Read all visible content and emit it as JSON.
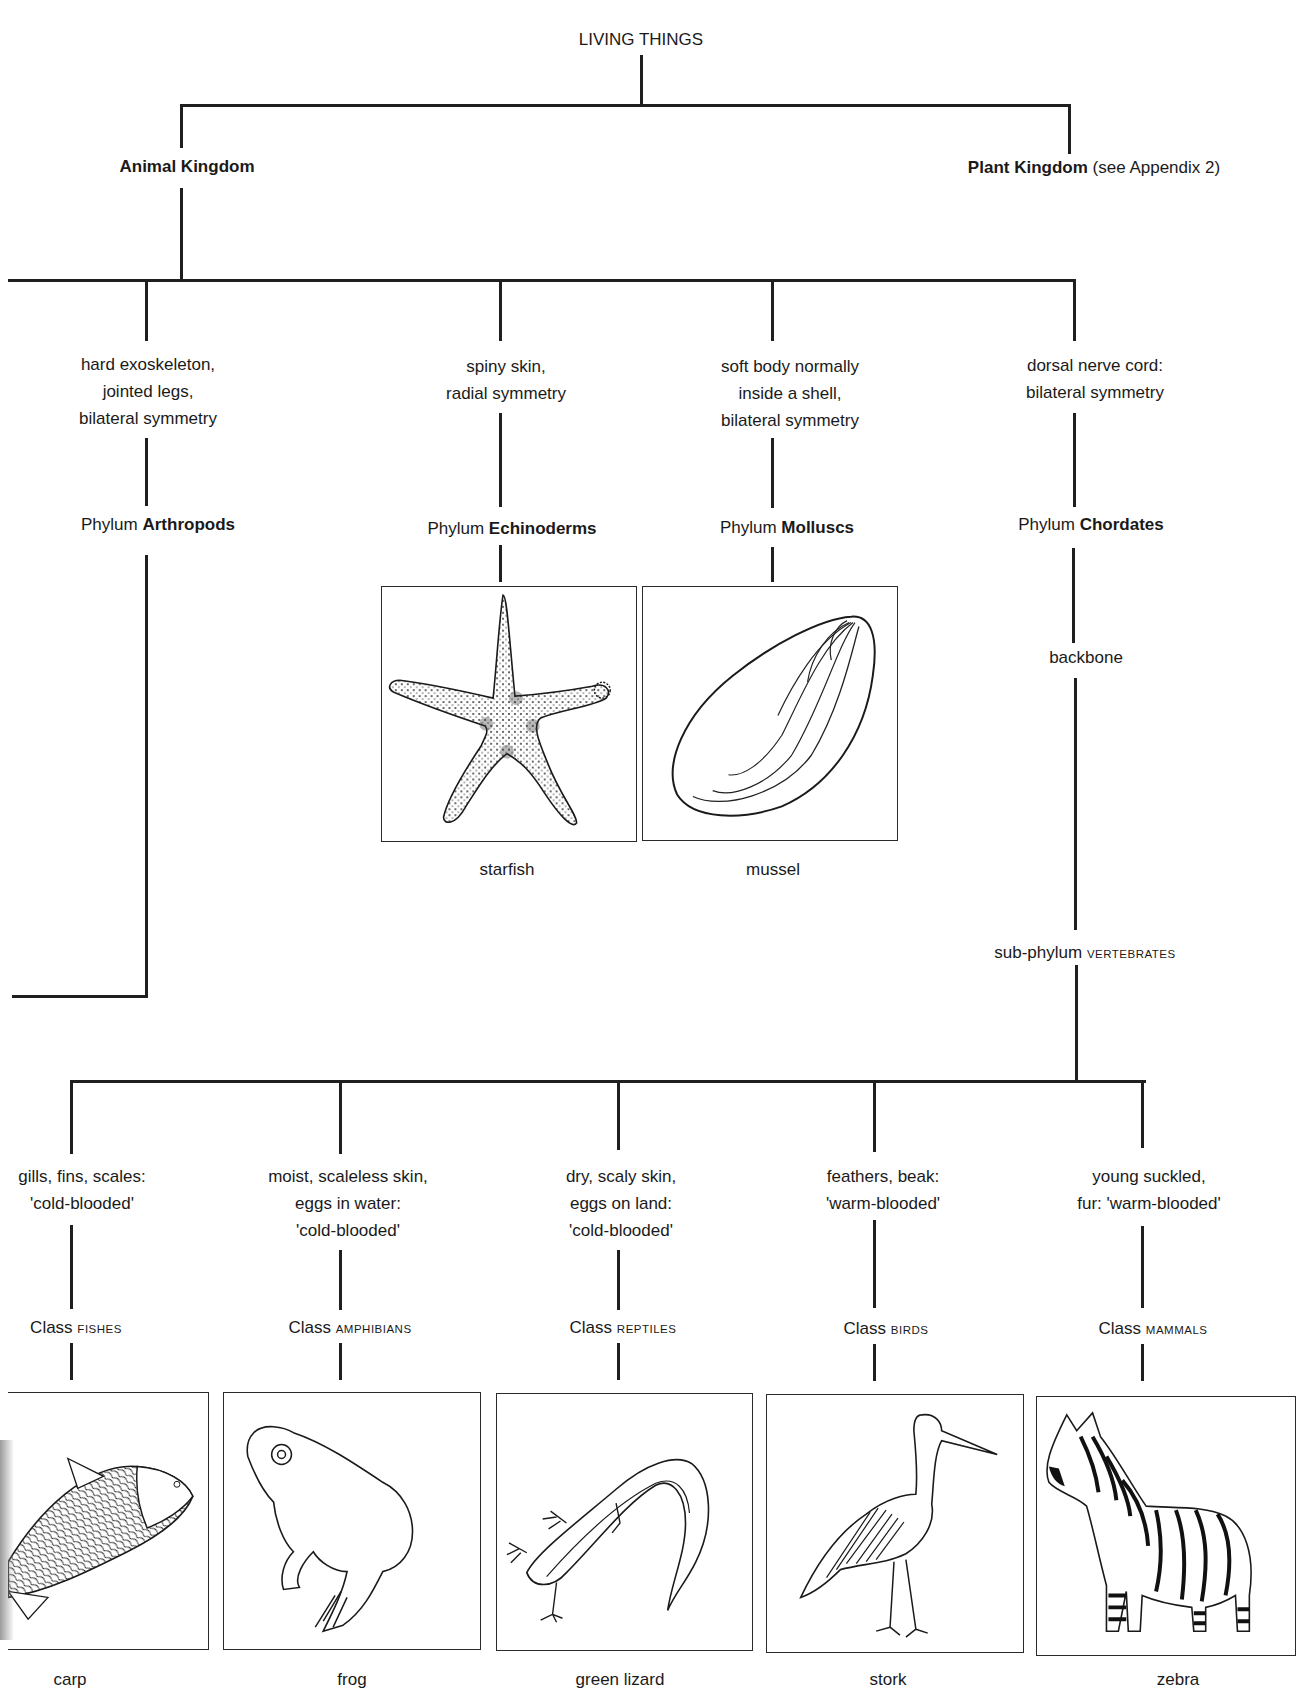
{
  "root": {
    "label": "LIVING THINGS"
  },
  "kingdoms": [
    {
      "name": "Animal Kingdom",
      "note": ""
    },
    {
      "name": "Plant Kingdom",
      "note": "(see Appendix 2)"
    }
  ],
  "phyla": [
    {
      "prefix": "Phylum",
      "name": "Arthropods",
      "features": [
        "hard exoskeleton,",
        "jointed legs,",
        "bilateral symmetry"
      ],
      "example": ""
    },
    {
      "prefix": "Phylum",
      "name": "Echinoderms",
      "features": [
        "spiny skin,",
        "radial symmetry"
      ],
      "example": "starfish",
      "icon": "starfish-illustration"
    },
    {
      "prefix": "Phylum",
      "name": "Molluscs",
      "features": [
        "soft body normally",
        "inside a shell,",
        "bilateral symmetry"
      ],
      "example": "mussel",
      "icon": "mussel-illustration"
    },
    {
      "prefix": "Phylum",
      "name": "Chordates",
      "features": [
        "dorsal nerve cord:",
        "bilateral symmetry"
      ],
      "example": ""
    }
  ],
  "chordate_branch": {
    "feature": "backbone",
    "subphylum_prefix": "sub-phylum",
    "subphylum_name": "vertebrates"
  },
  "classes": [
    {
      "prefix": "Class",
      "name": "fishes",
      "features": [
        "gills, fins, scales:",
        "'cold-blooded'"
      ],
      "example": "carp",
      "icon": "carp-illustration"
    },
    {
      "prefix": "Class",
      "name": "amphibians",
      "features": [
        "moist, scaleless skin,",
        "eggs in water:",
        "'cold-blooded'"
      ],
      "example": "frog",
      "icon": "frog-illustration"
    },
    {
      "prefix": "Class",
      "name": "reptiles",
      "features": [
        "dry, scaly skin,",
        "eggs on land:",
        "'cold-blooded'"
      ],
      "example": "green lizard",
      "icon": "lizard-illustration"
    },
    {
      "prefix": "Class",
      "name": "birds",
      "features": [
        "feathers, beak:",
        "'warm-blooded'"
      ],
      "example": "stork",
      "icon": "stork-illustration"
    },
    {
      "prefix": "Class",
      "name": "mammals",
      "features": [
        "young suckled,",
        "fur: 'warm-blooded'"
      ],
      "example": "zebra",
      "icon": "zebra-illustration"
    }
  ],
  "colors": {
    "line": "#1f1f1f",
    "text": "#1a1a1a",
    "background": "#ffffff"
  }
}
